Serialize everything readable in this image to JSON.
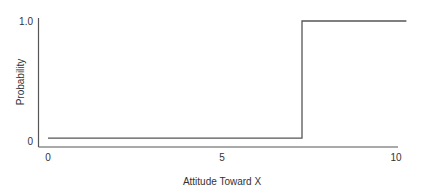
{
  "chart_data": {
    "type": "line",
    "title": "",
    "xlabel": "Attitude Toward X",
    "ylabel": "Probability",
    "xlim": [
      0,
      10
    ],
    "ylim": [
      0,
      1.0
    ],
    "x_ticks": [
      0,
      5,
      10
    ],
    "x_tick_labels": [
      "0",
      "5",
      "10"
    ],
    "y_ticks": [
      0,
      1.0
    ],
    "y_tick_labels": [
      "0",
      "1.0"
    ],
    "grid": false,
    "legend": null,
    "series": [
      {
        "name": "probability",
        "style": "step",
        "points": [
          [
            0,
            0.07
          ],
          [
            7.3,
            0.07
          ],
          [
            7.3,
            1.0
          ],
          [
            10.3,
            1.0
          ]
        ]
      }
    ]
  }
}
